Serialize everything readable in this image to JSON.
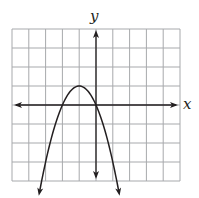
{
  "chart_data": {
    "type": "line",
    "title": "",
    "xlabel": "x",
    "ylabel": "y",
    "grid": true,
    "xlim": [
      -5,
      5
    ],
    "ylim": [
      -4,
      4
    ],
    "grid_columns": 10,
    "grid_rows": 8,
    "series": [
      {
        "name": "parabola",
        "equation": "y = -x^2 - 2x",
        "vertex": [
          -1,
          1
        ],
        "x_intercepts": [
          -2,
          0
        ],
        "y_intercept": 0,
        "opens": "down",
        "x": [
          -3.35,
          -3,
          -2.5,
          -2,
          -1.5,
          -1,
          -0.5,
          0,
          0.5,
          1,
          1.35
        ],
        "values": [
          -4.5,
          -3,
          -1.25,
          0,
          0.75,
          1,
          0.75,
          0,
          -1.25,
          -3,
          -4.5
        ]
      }
    ],
    "colors": {
      "curve": "#231f20",
      "grid": "#a7a9ac",
      "axes": "#231f20"
    }
  },
  "labels": {
    "x_axis": "x",
    "y_axis": "y"
  }
}
